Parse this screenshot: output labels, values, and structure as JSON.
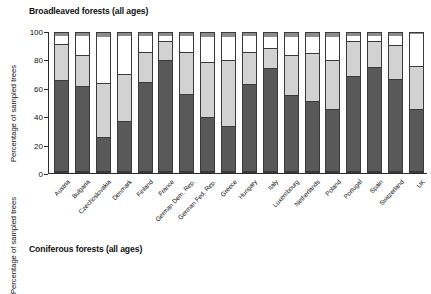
{
  "chart_data": [
    {
      "type": "bar",
      "subtype": "stacked-bar",
      "title": "Broadleaved forests (all ages)",
      "xlabel": "",
      "ylabel": "Percentage of sampled trees",
      "ylim": [
        0,
        100
      ],
      "yticks": [
        0,
        20,
        40,
        60,
        80,
        100
      ],
      "ytick_labels": [
        "0",
        "20",
        "40",
        "60",
        "80",
        "100"
      ],
      "grid": false,
      "legend": "none",
      "stacked_total": 100,
      "categories": [
        "Austria",
        "Bulgaria",
        "Czechoslovakia",
        "Denmark",
        "Finland",
        "France",
        "German Dem. Rep.",
        "German Fed. Rep.",
        "Greece",
        "Hungary",
        "Italy",
        "Luxembourg",
        "Netherlands",
        "Poland",
        "Portugal",
        "Spain",
        "Switzerland",
        "UK"
      ],
      "series": [
        {
          "name": "class-1-dark",
          "color": "#595959",
          "values": [
            66,
            62,
            24,
            36,
            65,
            81,
            56,
            39,
            32,
            63,
            75,
            55,
            51,
            45,
            69,
            76,
            67,
            45
          ]
        },
        {
          "name": "class-2-lightgrey",
          "color": "#d2d2d2",
          "values": [
            26,
            22,
            39,
            34,
            21,
            13,
            30,
            40,
            48,
            23,
            14,
            29,
            34,
            35,
            25,
            18,
            24,
            31
          ]
        },
        {
          "name": "class-3-white",
          "color": "#ffffff",
          "values": [
            6,
            14,
            34,
            28,
            12,
            4,
            12,
            18,
            17,
            12,
            8,
            13,
            12,
            17,
            4,
            4,
            7,
            23
          ]
        },
        {
          "name": "class-4-midgrey",
          "color": "#8c8c8c",
          "values": [
            2,
            2,
            3,
            2,
            2,
            2,
            2,
            3,
            3,
            2,
            3,
            3,
            3,
            3,
            2,
            2,
            2,
            1
          ]
        }
      ]
    },
    {
      "type": "bar",
      "subtype": "stacked-bar",
      "title": "Coniferous forests (all ages)",
      "xlabel": "",
      "ylabel": "Percentage of sampled trees",
      "ylim": [
        0,
        100
      ],
      "yticks": [
        0,
        20,
        40,
        60,
        80,
        100
      ],
      "ytick_labels": [
        "0",
        "20",
        "40",
        "60",
        "80",
        "100"
      ],
      "grid": false,
      "legend": "none",
      "note": "Lower panel is cropped at the bottom edge of the screenshot; only the upper portion of the bars is visible.",
      "stacked_total": 100,
      "categories": [
        "Austria",
        "Bulgaria",
        "Czechoslovakia",
        "Denmark",
        "Finland",
        "France",
        "German Dem. Rep.",
        "German Fed. Rep.",
        "Greece",
        "Hungary",
        "Italy",
        "Luxembourg",
        "Netherlands",
        "Poland",
        "Portugal",
        "Spain",
        "Switzerland",
        "UK"
      ],
      "series": [
        {
          "name": "class-1-dark",
          "color": "#595959",
          "values": [
            30,
            37,
            28,
            34,
            32,
            30,
            26,
            27,
            40,
            29,
            27,
            29,
            31,
            26,
            22,
            30,
            28,
            42
          ]
        },
        {
          "name": "class-2-lightgrey",
          "color": "#d2d2d2",
          "values": [
            52,
            48,
            40,
            47,
            50,
            48,
            52,
            51,
            40,
            50,
            53,
            51,
            49,
            52,
            40,
            46,
            52,
            44
          ]
        },
        {
          "name": "class-3-white",
          "color": "#ffffff",
          "values": [
            16,
            13,
            21,
            17,
            16,
            20,
            20,
            20,
            18,
            19,
            18,
            18,
            18,
            20,
            22,
            22,
            18,
            12
          ]
        },
        {
          "name": "class-4-midgrey",
          "color": "#8c8c8c",
          "values": [
            2,
            2,
            11,
            2,
            2,
            2,
            2,
            2,
            2,
            2,
            2,
            2,
            2,
            2,
            16,
            2,
            2,
            2
          ]
        }
      ]
    }
  ]
}
